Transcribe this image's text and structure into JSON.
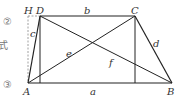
{
  "diagram": {
    "vertices": {
      "A": {
        "label": "A",
        "x": 28,
        "y": 83
      },
      "B": {
        "label": "B",
        "x": 172,
        "y": 83
      },
      "C": {
        "label": "C",
        "x": 135,
        "y": 16
      },
      "D": {
        "label": "D",
        "x": 40,
        "y": 16
      },
      "H": {
        "label": "H",
        "x": 28,
        "y": 16
      }
    },
    "segments": {
      "a": "a",
      "b": "b",
      "c": "c",
      "d": "d",
      "e": "e",
      "f": "f"
    },
    "side_text": {
      "marker2": "②",
      "formula": "式",
      "marker3": "③"
    },
    "colors": {
      "line": "#222222",
      "dashed": "#888888",
      "label": "#333333"
    }
  }
}
